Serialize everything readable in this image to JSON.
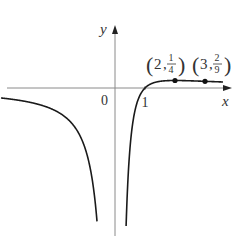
{
  "chart_data": {
    "type": "line",
    "title": "",
    "function": "y = (x - 1) / x^2",
    "xlabel": "x",
    "ylabel": "y",
    "origin_label": "0",
    "x_ticks": [
      {
        "value": 1,
        "label": "1"
      }
    ],
    "xlim": [
      -3.8,
      3.6
    ],
    "ylim": [
      -5,
      2.4
    ],
    "grid": false,
    "vertical_asymptote": 0,
    "highlighted_points": [
      {
        "x": 2,
        "y": 0.25,
        "label": "(2, 1/4)",
        "label_x": "2",
        "label_num": "1",
        "label_den": "4"
      },
      {
        "x": 3,
        "y": 0.2222,
        "label": "(3, 2/9)",
        "label_x": "3",
        "label_num": "2",
        "label_den": "9"
      }
    ],
    "series": [
      {
        "name": "left branch",
        "x_range": [
          -3.8,
          -0.6
        ]
      },
      {
        "name": "right branch",
        "x_range": [
          0.37,
          3.6
        ]
      }
    ],
    "colors": {
      "curve": "#1a1a1a",
      "axis": "#888888"
    }
  }
}
